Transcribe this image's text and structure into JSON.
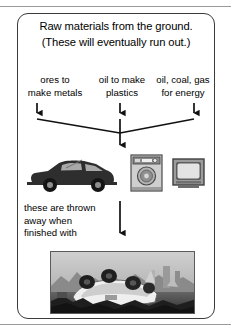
{
  "diagram": {
    "title_lines": [
      "Raw materials from the ground.",
      "(These will eventually run out.)"
    ],
    "sources": [
      {
        "line1": "ores to",
        "line2": "make metals",
        "icon": "down-arrow-icon"
      },
      {
        "line1": "oil to make",
        "line2": "plastics",
        "icon": "down-arrow-icon"
      },
      {
        "line1": "oil, coal, gas",
        "line2": "for energy",
        "icon": "down-arrow-icon"
      }
    ],
    "products": [
      {
        "name": "car-illustration",
        "label": "car"
      },
      {
        "name": "washing-machine-illustration",
        "label": "washing machine"
      },
      {
        "name": "television-illustration",
        "label": "television"
      }
    ],
    "disposal_caption_lines": [
      "these are thrown",
      "away when",
      "finished with"
    ],
    "bottom_photo": {
      "name": "scrapyard-photo",
      "label": "wrecked car in a scrapyard"
    },
    "colors": {
      "border": "#3a3a3a",
      "text": "#000000",
      "arrow": "#111111",
      "background": "#ffffff",
      "photo_tone": "#8e8e8e"
    }
  }
}
